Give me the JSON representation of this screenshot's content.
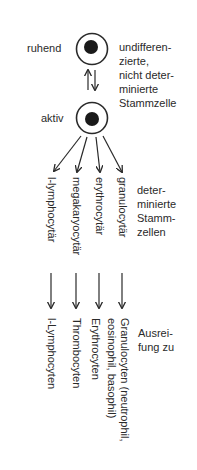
{
  "stem_cell": {
    "resting_label": "ruhend",
    "active_label": "aktiv",
    "description_lines": [
      "undifferen-",
      "zierte,",
      "nicht deter-",
      "minierte",
      "Stammzelle"
    ]
  },
  "determined": {
    "description_lines": [
      "deter-",
      "minierte",
      "Stamm-",
      "zellen"
    ],
    "lineages": [
      {
        "label": "l-lymphocytär"
      },
      {
        "label": "megakaryocytär"
      },
      {
        "label": "erythrocytär"
      },
      {
        "label": "granulocytär"
      }
    ]
  },
  "maturation": {
    "description_lines": [
      "Ausrei-",
      "fung zu"
    ],
    "products": [
      {
        "lines": [
          "l-Lymphocyten"
        ]
      },
      {
        "lines": [
          "Thrombocyten"
        ]
      },
      {
        "lines": [
          "Erythrocyten"
        ]
      },
      {
        "lines": [
          "Granulocyten (neutrophil,",
          "eosinophil, basophil)"
        ]
      }
    ]
  },
  "colors": {
    "ink": "#2a2a2a",
    "background": "#ffffff"
  }
}
